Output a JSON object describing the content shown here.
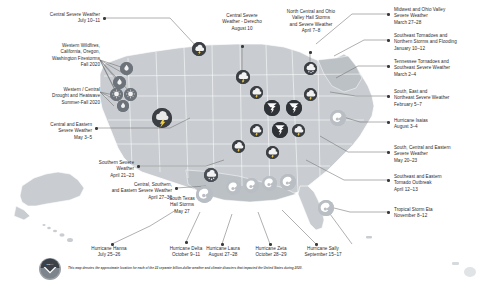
{
  "caption": "This map denotes the approximate location for each of the 22 separate billion-dollar weather and climate disasters that impacted the United States during 2020.",
  "logo": {
    "name": "noaa-logo",
    "text": "NOAA"
  },
  "colors": {
    "map_land": "#c9cdd1",
    "map_land_alt": "#bcc1c6",
    "marker_dark": "#3b3f44",
    "marker_mid": "#6d737a",
    "marker_light": "#b9bec4",
    "leader_line": "#6e6e6e",
    "text": "#2b2b2b"
  },
  "events": [
    {
      "id": 1,
      "label": "Central Severe Weather\nJuly 10–11",
      "side": "left",
      "icon": "severe-storm-icon"
    },
    {
      "id": 2,
      "label": "Western Wildfires,\nCalifornia, Oregon,\nWashington Firestorms\nFall 2020",
      "side": "left",
      "icon": "wildfire-icon"
    },
    {
      "id": 3,
      "label": "Western / Central\nDrought and Heatwave\nSummer-Fall 2020",
      "side": "left",
      "icon": "drought-icon"
    },
    {
      "id": 4,
      "label": "Central and Eastern\nSevere Weather\nMay 3–5",
      "side": "left",
      "icon": "severe-storm-icon"
    },
    {
      "id": 5,
      "label": "Southern Severe\nWeather\nApril 21–23",
      "side": "left",
      "icon": "severe-storm-icon"
    },
    {
      "id": 6,
      "label": "Central, Southern,\nand Eastern Severe Weather\nApril 27–30",
      "side": "left",
      "icon": "severe-storm-icon"
    },
    {
      "id": 7,
      "label": "Hurricane Hanna\nJuly 25–26",
      "side": "bottom",
      "icon": "hurricane-icon"
    },
    {
      "id": 8,
      "label": "South Texas\nHail Storms\nMay 27",
      "side": "bottom",
      "icon": "hail-icon"
    },
    {
      "id": 9,
      "label": "Hurricane Delta\nOctober 9–11",
      "side": "bottom",
      "icon": "hurricane-icon"
    },
    {
      "id": 10,
      "label": "Hurricane Laura\nAugust 27–28",
      "side": "bottom",
      "icon": "hurricane-icon"
    },
    {
      "id": 11,
      "label": "Hurricane Zeta\nOctober 28–29",
      "side": "bottom",
      "icon": "hurricane-icon"
    },
    {
      "id": 12,
      "label": "Hurricane Sally\nSeptember 15–17",
      "side": "bottom",
      "icon": "hurricane-icon"
    },
    {
      "id": 13,
      "label": "Central Severe\nWeather - Derecho\nAugust 10",
      "side": "top",
      "icon": "derecho-icon"
    },
    {
      "id": 14,
      "label": "North Central and Ohio\nValley Hail Storms\nand Severe Weather\nApril 7–8",
      "side": "top",
      "icon": "hail-icon"
    },
    {
      "id": 15,
      "label": "Midwest and Ohio Valley\nSevere Weather\nMarch 27–28",
      "side": "right",
      "icon": "severe-storm-icon"
    },
    {
      "id": 16,
      "label": "Southeast Tornadoes and\nNorthern Storms and Flooding\nJanuary 10–12",
      "side": "right",
      "icon": "tornado-icon"
    },
    {
      "id": 17,
      "label": "Tennessee Tornadoes and\nSoutheast Severe Weather\nMarch 2–4",
      "side": "right",
      "icon": "tornado-icon"
    },
    {
      "id": 18,
      "label": "South, East and\nNortheast Severe Weather\nFebruary 5–7",
      "side": "right",
      "icon": "severe-storm-icon"
    },
    {
      "id": 19,
      "label": "Hurricane Isaias\nAugust 3–4",
      "side": "right",
      "icon": "hurricane-icon"
    },
    {
      "id": 20,
      "label": "South, Central and Eastern\nSevere Weather\nMay 20–23",
      "side": "right",
      "icon": "severe-storm-icon"
    },
    {
      "id": 21,
      "label": "Southeast and Eastern\nTornado Outbreak\nApril 12–13",
      "side": "right",
      "icon": "tornado-icon"
    },
    {
      "id": 22,
      "label": "Tropical Storm Eta\nNovember 8–12",
      "side": "right",
      "icon": "hurricane-icon"
    }
  ]
}
